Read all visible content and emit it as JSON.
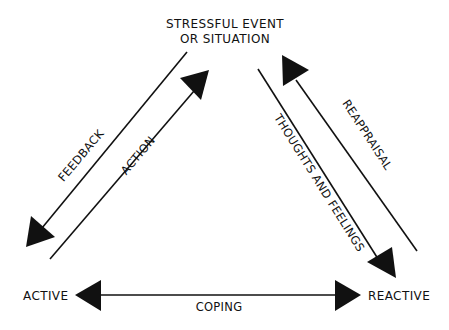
{
  "diagram": {
    "nodes": {
      "top_line1": "STRESSFUL EVENT",
      "top_line2": "OR SITUATION",
      "left": "ACTIVE",
      "right": "REACTIVE"
    },
    "edges": {
      "feedback": "FEEDBACK",
      "action": "ACTION",
      "thoughts": "THOUGHTS AND FEELINGS",
      "reappraisal": "REAPPRAISAL",
      "coping": "COPING"
    },
    "colors": {
      "ink": "#111111",
      "background": "#ffffff"
    }
  }
}
